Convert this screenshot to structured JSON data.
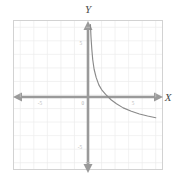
{
  "figure": {
    "background": "#ffffff",
    "frame_color": "#d2d2d2",
    "grid_color": "#ededed",
    "axis_color": "#9a9a9a",
    "curve_color": "#8a8a8a",
    "tick_label_color": "#b9b9b9"
  },
  "labels": {
    "x_axis_title": "X",
    "y_axis_title": "Y",
    "origin": "0"
  },
  "chart_data": {
    "type": "line",
    "title": "",
    "xlabel": "X",
    "ylabel": "Y",
    "xlim": [
      -5.5,
      5.5
    ],
    "ylim": [
      -5.5,
      5.5
    ],
    "grid": true,
    "legend": "none",
    "x_ticks": [
      -5,
      5
    ],
    "x_tick_labels": [
      "-5",
      "5"
    ],
    "y_ticks": [
      5,
      -5
    ],
    "y_tick_labels": [
      "5",
      "-5"
    ],
    "annotations": [
      "vertical asymptote at x = 0",
      "horizontal asymptote approached from above as x increases"
    ],
    "series": [
      {
        "name": "decaying hyperbola",
        "description": "reciprocal curve in the right half-plane, falling steeply near the y-axis and flattening toward the right",
        "x": [
          0.18,
          0.22,
          0.28,
          0.35,
          0.45,
          0.6,
          0.8,
          1.0,
          1.3,
          1.7,
          2.1,
          2.6,
          3.2,
          3.8,
          4.4,
          5.0
        ],
        "y": [
          5.2,
          4.3,
          3.4,
          2.6,
          1.9,
          1.3,
          0.75,
          0.4,
          0.05,
          -0.35,
          -0.65,
          -0.95,
          -1.2,
          -1.4,
          -1.55,
          -1.68
        ]
      }
    ]
  }
}
